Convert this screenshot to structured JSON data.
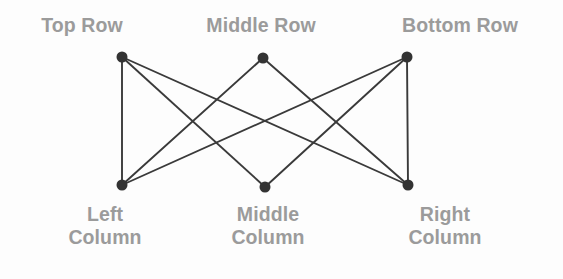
{
  "diagram": {
    "background_color": "#fdfdfd",
    "node_color": "#333333",
    "edge_color": "#3a3a3a",
    "label_color": "#9b9b9b",
    "node_radius": 5.5,
    "edge_width": 1.9,
    "nodes": [
      {
        "id": "top-left",
        "label": "Top Row",
        "x": 122,
        "y": 57
      },
      {
        "id": "top-middle",
        "label": "Middle Row",
        "x": 263,
        "y": 58
      },
      {
        "id": "top-right",
        "label": "Bottom Row",
        "x": 407,
        "y": 57
      },
      {
        "id": "bottom-left",
        "label": "Left Column",
        "x": 122,
        "y": 185
      },
      {
        "id": "bottom-middle",
        "label": "Middle Column",
        "x": 265,
        "y": 187
      },
      {
        "id": "bottom-right",
        "label": "Right Column",
        "x": 408,
        "y": 185
      }
    ],
    "edges": [
      {
        "from": "top-left",
        "to": "bottom-left"
      },
      {
        "from": "top-left",
        "to": "bottom-middle"
      },
      {
        "from": "top-left",
        "to": "bottom-right"
      },
      {
        "from": "top-middle",
        "to": "bottom-left"
      },
      {
        "from": "top-middle",
        "to": "bottom-right"
      },
      {
        "from": "top-right",
        "to": "bottom-left"
      },
      {
        "from": "top-right",
        "to": "bottom-middle"
      },
      {
        "from": "top-right",
        "to": "bottom-right"
      }
    ],
    "row_labels": [
      {
        "id": "top-row-label",
        "text": "Top Row",
        "x": 82
      },
      {
        "id": "middle-row-label",
        "text": "Middle Row",
        "x": 261
      },
      {
        "id": "bottom-row-label",
        "text": "Bottom Row",
        "x": 460
      }
    ],
    "column_labels": [
      {
        "id": "left-column-label",
        "line1": "Left",
        "line2": "Column",
        "x": 105
      },
      {
        "id": "middle-column-label",
        "line1": "Middle",
        "line2": "Column",
        "x": 268
      },
      {
        "id": "right-column-label",
        "line1": "Right",
        "line2": "Column",
        "x": 445
      }
    ]
  }
}
